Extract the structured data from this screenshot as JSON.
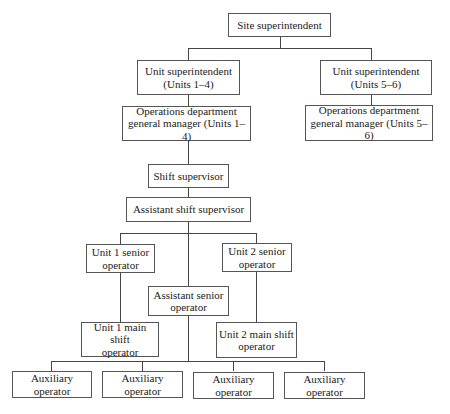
{
  "diagram": {
    "type": "org-chart",
    "nodes": {
      "site_superintendent": {
        "line1": "Site superintendent",
        "line2": ""
      },
      "unit_sup_1_4": {
        "line1": "Unit superintendent",
        "line2": "(Units 1–4)"
      },
      "unit_sup_5_6": {
        "line1": "Unit superintendent",
        "line2": "(Units 5–6)"
      },
      "ops_gm_1_4": {
        "line1": "Operations department",
        "line2": "general manager (Units 1–4)"
      },
      "ops_gm_5_6": {
        "line1": "Operations department",
        "line2": "general manager (Units 5–6)"
      },
      "shift_supervisor": {
        "line1": "Shift supervisor",
        "line2": ""
      },
      "asst_shift_supervisor": {
        "line1": "Assistant shift supervisor",
        "line2": ""
      },
      "unit1_senior": {
        "line1": "Unit 1 senior",
        "line2": "operator"
      },
      "unit2_senior": {
        "line1": "Unit 2 senior",
        "line2": "operator"
      },
      "asst_senior": {
        "line1": "Assistant senior",
        "line2": "operator"
      },
      "unit1_main_shift": {
        "line1": "Unit 1 main shift",
        "line2": "operator"
      },
      "unit2_main_shift": {
        "line1": "Unit 2 main shift",
        "line2": "operator"
      },
      "aux": [
        {
          "line1": "Auxiliary",
          "line2": "operator"
        },
        {
          "line1": "Auxiliary",
          "line2": "operator"
        },
        {
          "line1": "Auxiliary",
          "line2": "operator"
        },
        {
          "line1": "Auxiliary",
          "line2": "operator"
        }
      ]
    },
    "edges": [
      [
        "site_superintendent",
        "unit_sup_1_4"
      ],
      [
        "site_superintendent",
        "unit_sup_5_6"
      ],
      [
        "unit_sup_1_4",
        "ops_gm_1_4"
      ],
      [
        "unit_sup_5_6",
        "ops_gm_5_6"
      ],
      [
        "ops_gm_1_4",
        "shift_supervisor"
      ],
      [
        "shift_supervisor",
        "asst_shift_supervisor"
      ],
      [
        "asst_shift_supervisor",
        "unit1_senior"
      ],
      [
        "asst_shift_supervisor",
        "unit2_senior"
      ],
      [
        "asst_shift_supervisor",
        "asst_senior"
      ],
      [
        "unit1_senior",
        "unit1_main_shift"
      ],
      [
        "unit2_senior",
        "unit2_main_shift"
      ],
      [
        "asst_senior",
        "aux"
      ]
    ]
  }
}
